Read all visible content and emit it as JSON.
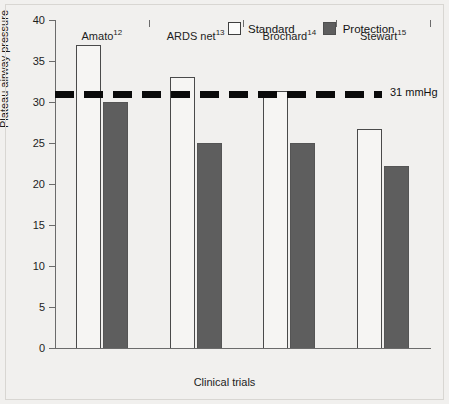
{
  "chart_data": {
    "type": "bar",
    "title": "",
    "xlabel": "Clinical trials",
    "ylabel": "Plateau airway pressure",
    "ylim": [
      0,
      40
    ],
    "yticks": [
      0,
      5,
      10,
      15,
      20,
      25,
      30,
      35,
      40
    ],
    "ytick_labels": [
      "0",
      "5",
      "10",
      "15",
      "20",
      "25",
      "30",
      "35",
      "40"
    ],
    "grid": false,
    "legend_position": "top-right",
    "categories": [
      "Amato12",
      "ARDS net13",
      "Brochard14",
      "Stewart15"
    ],
    "category_labels": [
      {
        "name": "Amato",
        "superscript": "12"
      },
      {
        "name": "ARDS net",
        "superscript": "13"
      },
      {
        "name": "Brochard",
        "superscript": "14"
      },
      {
        "name": "Stewart",
        "superscript": "15"
      }
    ],
    "series": [
      {
        "name": "Standard",
        "color": "#f6f5f3",
        "values": [
          37.0,
          33.0,
          31.3,
          26.7
        ]
      },
      {
        "name": "Protection",
        "color": "#5e5e5e",
        "values": [
          30.0,
          25.0,
          25.0,
          22.2
        ]
      }
    ],
    "annotations": [
      {
        "type": "threshold-line",
        "name": "threshold-line-31",
        "value": 31,
        "label": "31 mmHg",
        "style": "dashed",
        "color": "#0a0a0a"
      }
    ]
  },
  "legend": {
    "items": [
      {
        "label": "Standard",
        "swatch": "open-square-swatch"
      },
      {
        "label": "Protection",
        "swatch": "filled-square-swatch"
      }
    ]
  }
}
